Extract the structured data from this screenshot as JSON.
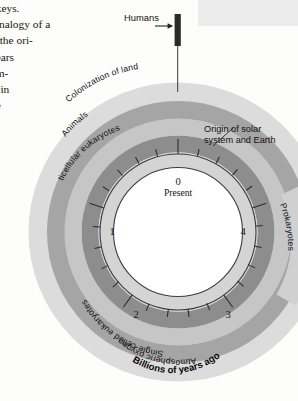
{
  "figure": {
    "center_label": "Billions of years ago",
    "present_number": "0",
    "present_label": "Present",
    "dial_numbers": [
      "0",
      "1",
      "2",
      "3",
      "4"
    ],
    "humans_marker_label": "Humans",
    "origin_callout_line1": "Origin of solar",
    "origin_callout_line2": "system and Earth",
    "bands": [
      {
        "label": "Colonization of land",
        "color": "#d9d9d9"
      },
      {
        "label": "Animals",
        "color": "#a8a8a8"
      },
      {
        "label": "Multicellular eukaryotes",
        "color": "#c4c4c4"
      },
      {
        "label": "Single-celled eukaryotes",
        "color": "#8f8f8f"
      },
      {
        "label": "Atmospheric oxygen",
        "color": "#d2d2d2"
      },
      {
        "label": "Prokaryotes",
        "color": "#cfcfcf"
      }
    ],
    "colors": {
      "dial_face": "#ffffff",
      "dial_outline": "#3a3a3a",
      "tick": "#2b2b2b",
      "humans_marker": "#2a2a2a",
      "corner_wash": "#ececec",
      "page_background": "#fdfdfc"
    }
  },
  "body_text": {
    "lines": [
      "nkeys.",
      "e analogy of a",
      "m the ori-",
      " years",
      "um-",
      "ts in",
      "ne"
    ]
  }
}
